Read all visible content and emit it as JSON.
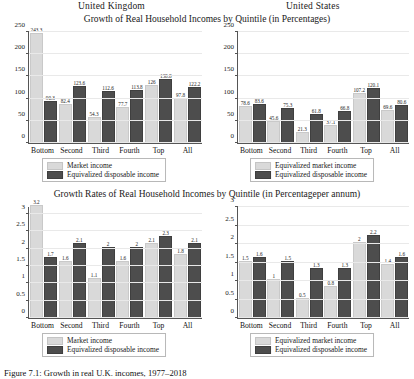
{
  "figure": {
    "country_left": "United Kingdom",
    "country_right": "United States",
    "title_top": "Growth of Real Household Incomes by Quintile (in Percentages)",
    "title_bottom": "Growth Rates of Real Household Incomes by Quintile (in Percentageper annum)",
    "caption": "Figure 7.1: Growth in real U.K. incomes, 1977–2018"
  },
  "legend": {
    "uk_light": "Market income",
    "uk_dark": "Equivalized disposable income",
    "us_light": "Equivalized market income",
    "us_dark": "Equivalized disposable income"
  },
  "chart_data": [
    {
      "type": "bar",
      "panel": "top-left",
      "title": "Growth of Real Household Incomes by Quintile (in Percentages)",
      "subtitle": "United Kingdom",
      "xlabel": "",
      "ylabel": "",
      "ylim": [
        0,
        250
      ],
      "yticks": [
        0,
        50,
        100,
        150,
        200,
        250
      ],
      "grid": true,
      "legend_position": "below",
      "categories": [
        "Bottom",
        "Second",
        "Third",
        "Fourth",
        "Top",
        "All"
      ],
      "series": [
        {
          "name": "Market income",
          "color": "#d9d9d9",
          "values": [
            243.3,
            82.4,
            54.3,
            77.7,
            126.0,
            97.8
          ]
        },
        {
          "name": "Equivalized disposable income",
          "color": "#4d4d4d",
          "values": [
            90.3,
            123.6,
            112.6,
            113.8,
            138.8,
            122.2
          ]
        }
      ]
    },
    {
      "type": "bar",
      "panel": "top-right",
      "title": "Growth of Real Household Incomes by Quintile (in Percentages)",
      "subtitle": "United States",
      "xlabel": "",
      "ylabel": "",
      "ylim": [
        0,
        250
      ],
      "yticks": [
        0,
        50,
        100,
        150,
        200,
        250
      ],
      "grid": true,
      "legend_position": "below",
      "categories": [
        "Bottom",
        "Second",
        "Third",
        "Fourth",
        "Top",
        "All"
      ],
      "series": [
        {
          "name": "Equivalized market income",
          "color": "#d9d9d9",
          "values": [
            78.6,
            45.6,
            21.3,
            37.1,
            107.2,
            69.6
          ]
        },
        {
          "name": "Equivalized disposable income",
          "color": "#4d4d4d",
          "values": [
            83.6,
            75.3,
            61.8,
            66.8,
            120.1,
            80.6
          ]
        }
      ]
    },
    {
      "type": "bar",
      "panel": "bottom-left",
      "title": "Growth Rates of Real Household Incomes by Quintile (in Percentageper annum)",
      "subtitle": "United Kingdom",
      "xlabel": "",
      "ylabel": "",
      "ylim": [
        0,
        3.2
      ],
      "yticks": [
        0,
        0.5,
        1,
        1.5,
        2,
        2.5,
        3
      ],
      "grid": true,
      "legend_position": "below",
      "categories": [
        "Bottom",
        "Second",
        "Third",
        "Fourth",
        "Top",
        "All"
      ],
      "series": [
        {
          "name": "Market income",
          "color": "#d9d9d9",
          "values": [
            3.2,
            1.6,
            1.1,
            1.6,
            2.1,
            1.8
          ]
        },
        {
          "name": "Equivalized disposable income",
          "color": "#4d4d4d",
          "values": [
            1.7,
            2.1,
            2.0,
            2.0,
            2.3,
            2.1
          ]
        }
      ]
    },
    {
      "type": "bar",
      "panel": "bottom-right",
      "title": "Growth Rates of Real Household Incomes by Quintile (in Percentageper annum)",
      "subtitle": "United States",
      "xlabel": "",
      "ylabel": "",
      "ylim": [
        0,
        3.0
      ],
      "yticks": [
        0,
        0.5,
        1,
        1.5,
        2,
        2.5,
        3
      ],
      "grid": true,
      "legend_position": "below",
      "categories": [
        "Bottom",
        "Second",
        "Third",
        "Fourth",
        "Top",
        "All"
      ],
      "series": [
        {
          "name": "Equivalized market income",
          "color": "#d9d9d9",
          "values": [
            1.5,
            1.0,
            0.5,
            0.8,
            2.0,
            1.4
          ]
        },
        {
          "name": "Equivalized disposable income",
          "color": "#4d4d4d",
          "values": [
            1.6,
            1.5,
            1.3,
            1.3,
            2.2,
            1.6
          ]
        }
      ]
    }
  ]
}
